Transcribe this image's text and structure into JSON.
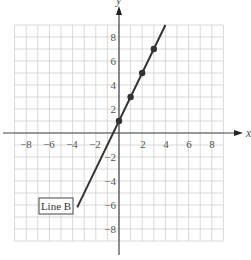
{
  "chart_data": {
    "type": "line",
    "title": "",
    "xlabel": "x",
    "ylabel": "y",
    "xlim": [
      -9,
      9
    ],
    "ylim": [
      -9,
      9
    ],
    "grid": true,
    "x_ticks": [
      -8,
      -6,
      -4,
      -2,
      2,
      4,
      6,
      8
    ],
    "y_ticks": [
      8,
      6,
      4,
      2,
      -2,
      -4,
      -6,
      -8
    ],
    "series": [
      {
        "name": "Line B",
        "equation": "y = 2x + 1",
        "line_from": [
          -3.6,
          -6.2
        ],
        "line_to": [
          4,
          9
        ],
        "points": [
          [
            0,
            1
          ],
          [
            1,
            3
          ],
          [
            2,
            5
          ],
          [
            3,
            7
          ]
        ]
      }
    ],
    "annotations": [
      {
        "text": "Line B",
        "x": -5.5,
        "y": -6
      }
    ]
  },
  "tick_labels": {
    "x": [
      "−8",
      "−6",
      "−4",
      "−2",
      "2",
      "4",
      "6",
      "8"
    ],
    "y": [
      "8",
      "6",
      "4",
      "2",
      "−2",
      "−4",
      "−6",
      "−8"
    ]
  },
  "axis_labels": {
    "x": "x",
    "y": "y"
  },
  "legend_label": "Line B"
}
